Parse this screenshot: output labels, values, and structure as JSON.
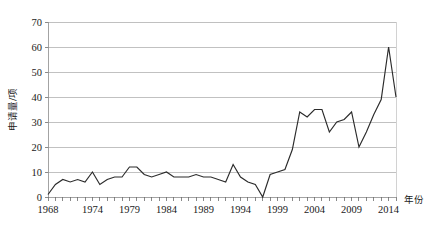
{
  "chart_data": {
    "type": "line",
    "title": "",
    "xlabel": "年份",
    "ylabel": "申请量/项",
    "xlim": [
      1968,
      2015
    ],
    "ylim": [
      0,
      70
    ],
    "ytick_step": 10,
    "grid": true,
    "legend": "none",
    "yticks": [
      0,
      10,
      20,
      30,
      40,
      50,
      60,
      70
    ],
    "xtick_labels": [
      "1968",
      "1974",
      "1979",
      "1984",
      "1989",
      "1994",
      "1999",
      "2004",
      "2009",
      "2014"
    ],
    "xtick_values": [
      1968,
      1974,
      1979,
      1984,
      1989,
      1994,
      1999,
      2004,
      2009,
      2014
    ],
    "x": [
      1968,
      1969,
      1970,
      1971,
      1972,
      1973,
      1974,
      1975,
      1976,
      1977,
      1978,
      1979,
      1980,
      1981,
      1982,
      1983,
      1984,
      1985,
      1986,
      1987,
      1988,
      1989,
      1990,
      1991,
      1992,
      1993,
      1994,
      1995,
      1996,
      1997,
      1998,
      1999,
      2000,
      2001,
      2002,
      2003,
      2004,
      2005,
      2006,
      2007,
      2008,
      2009,
      2010,
      2011,
      2012,
      2013,
      2014,
      2015
    ],
    "values": [
      1,
      5,
      7,
      6,
      7,
      6,
      10,
      5,
      7,
      8,
      8,
      12,
      12,
      9,
      8,
      9,
      10,
      8,
      8,
      8,
      9,
      8,
      8,
      7,
      6,
      13,
      8,
      6,
      5,
      0,
      9,
      10,
      11,
      19,
      34,
      32,
      35,
      35,
      26,
      30,
      31,
      34,
      20,
      26,
      33,
      39,
      60,
      40
    ],
    "series": [
      {
        "name": "申请量",
        "values": [
          1,
          5,
          7,
          6,
          7,
          6,
          10,
          5,
          7,
          8,
          8,
          12,
          12,
          9,
          8,
          9,
          10,
          8,
          8,
          8,
          9,
          8,
          8,
          7,
          6,
          13,
          8,
          6,
          5,
          0,
          9,
          10,
          11,
          19,
          34,
          32,
          35,
          35,
          26,
          30,
          31,
          34,
          20,
          26,
          33,
          39,
          60,
          40
        ]
      }
    ],
    "colors": {
      "line": "#2b2b2b",
      "grid": "#a6a6a6",
      "axis": "#8c8c8c",
      "background": "#ffffff"
    }
  }
}
